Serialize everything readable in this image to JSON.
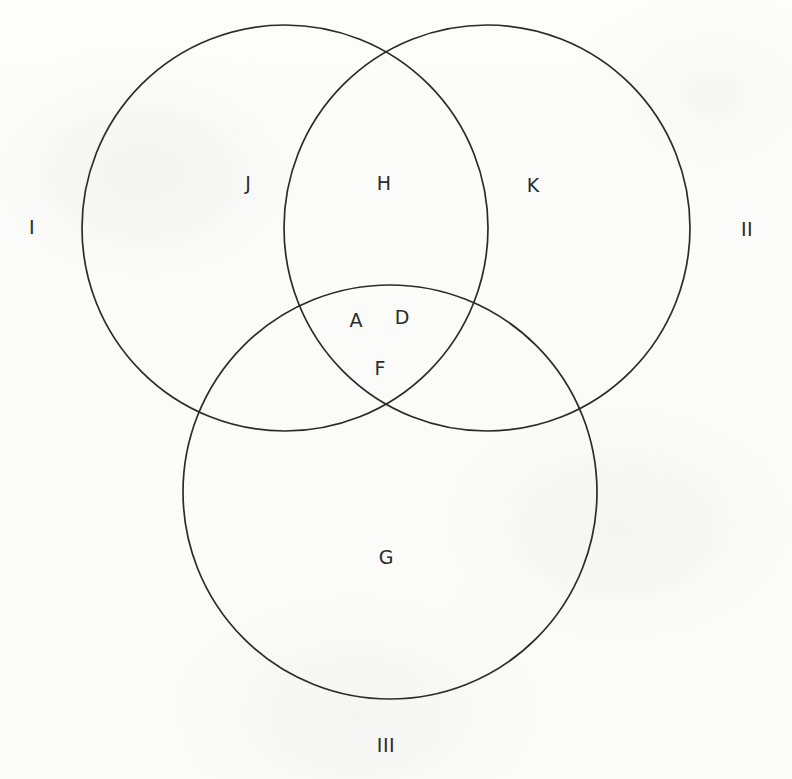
{
  "diagram": {
    "type": "venn-3-circle",
    "background_color": "#fcfcfb",
    "stroke_color": "#2b2b2b",
    "text_color": "#2b2b2b",
    "set_labels": [
      {
        "id": "set-1",
        "text": "I",
        "x": 32,
        "y": 227
      },
      {
        "id": "set-2",
        "text": "II",
        "x": 747,
        "y": 229
      },
      {
        "id": "set-3",
        "text": "III",
        "x": 386,
        "y": 745
      }
    ],
    "region_labels": [
      {
        "id": "region-j",
        "text": "J",
        "x": 248,
        "y": 183,
        "region": "I only"
      },
      {
        "id": "region-h",
        "text": "H",
        "x": 384,
        "y": 183,
        "region": "I and II"
      },
      {
        "id": "region-k",
        "text": "K",
        "x": 533,
        "y": 185,
        "region": "II only"
      },
      {
        "id": "region-a",
        "text": "A",
        "x": 356,
        "y": 320,
        "region": "I, II and III"
      },
      {
        "id": "region-d",
        "text": "D",
        "x": 402,
        "y": 317,
        "region": "I, II and III"
      },
      {
        "id": "region-f",
        "text": "F",
        "x": 380,
        "y": 368,
        "region": "I, II and III"
      },
      {
        "id": "region-g",
        "text": "G",
        "x": 386,
        "y": 557,
        "region": "III only"
      }
    ],
    "circles": [
      {
        "id": "circle-1",
        "label": "I",
        "cx": 285,
        "cy": 228,
        "r": 203
      },
      {
        "id": "circle-2",
        "label": "II",
        "cx": 487,
        "cy": 228,
        "r": 203
      },
      {
        "id": "circle-3",
        "label": "III",
        "cx": 390,
        "cy": 492,
        "r": 207
      }
    ]
  }
}
